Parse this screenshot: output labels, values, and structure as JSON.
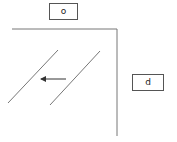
{
  "diagram": {
    "labels": [
      {
        "id": "top",
        "text": "o",
        "x": 49,
        "y": 3,
        "w": 29,
        "h": 17
      },
      {
        "id": "right",
        "text": "d",
        "x": 132,
        "y": 74,
        "w": 32,
        "h": 17
      }
    ],
    "colors": {
      "stroke": "#777777",
      "arrow": "#333333",
      "box_border": "#555555",
      "background": "#ffffff"
    }
  }
}
